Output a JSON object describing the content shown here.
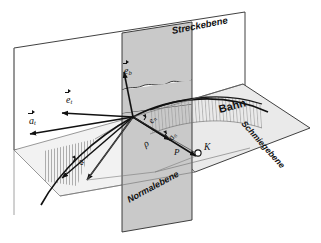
{
  "figure": {
    "language": "de",
    "background": "#ffffff",
    "ink": "#111111",
    "plane_fill": "#c9c9c9",
    "plane_fill_light": "#e8e8e8",
    "hatch_color": "#8a8a8a"
  },
  "planes": [
    {
      "id": "streckebene",
      "label": "Streckebene",
      "kind": "rectifying-plane",
      "style": "outline",
      "label_rotation_deg": -11
    },
    {
      "id": "normalebene",
      "label": "Normalebene",
      "kind": "normal-plane",
      "style": "filled-gray",
      "label_rotation_deg": -28
    },
    {
      "id": "schmiegebene",
      "label": "Schmiegebene",
      "kind": "osculating-plane",
      "style": "filled-light",
      "label_rotation_deg": 48
    }
  ],
  "curve": {
    "label": "Bahn",
    "meaning": "trajectory",
    "label_rotation_deg": -14
  },
  "points": [
    {
      "id": "P",
      "label": "P",
      "meaning": "point-on-trajectory",
      "x": 133,
      "y": 117
    },
    {
      "id": "K",
      "label": "K",
      "meaning": "center-of-curvature",
      "x": 198,
      "y": 153,
      "marker": "open-circle"
    }
  ],
  "measures": [
    {
      "id": "rho",
      "label": "ρ",
      "meaning": "radius-of-curvature"
    }
  ],
  "vectors": [
    {
      "id": "e_t",
      "base": "e",
      "sub": "t",
      "meaning": "tangent-unit-vector",
      "label_x": 68,
      "label_y": 100,
      "rotation_deg": 0
    },
    {
      "id": "e_n",
      "base": "e",
      "sub": "n",
      "meaning": "normal-unit-vector",
      "label_x": 154,
      "label_y": 120,
      "rotation_deg": -58
    },
    {
      "id": "e_b",
      "base": "e",
      "sub": "b",
      "meaning": "binormal-unit-vector",
      "label_x": 130,
      "label_y": 72,
      "rotation_deg": 0
    },
    {
      "id": "a_t",
      "base": "a",
      "sub": "t",
      "meaning": "tangential-acceleration",
      "label_x": 31,
      "label_y": 121,
      "rotation_deg": 0
    },
    {
      "id": "a_n",
      "base": "a",
      "sub": "n",
      "meaning": "normal-acceleration",
      "label_x": 173,
      "label_y": 136,
      "rotation_deg": -58
    },
    {
      "id": "a",
      "base": "a",
      "sub": "",
      "meaning": "total-acceleration",
      "label_x": 82,
      "label_y": 163,
      "rotation_deg": -62
    }
  ]
}
